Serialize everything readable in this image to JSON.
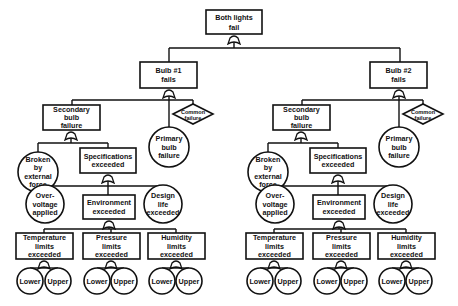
{
  "diagram": {
    "type": "fault-tree",
    "colors": {
      "stroke": "#111111",
      "background": "#ffffff",
      "caption": "#777777"
    },
    "top_event": {
      "lines": [
        "Both lights",
        "fail"
      ]
    },
    "branches": [
      {
        "id": "bulb1",
        "event": {
          "lines": [
            "Bulb #1",
            "fails"
          ]
        },
        "secondary": {
          "lines": [
            "Secondary",
            "bulb",
            "failure"
          ]
        },
        "primary": {
          "lines": [
            "Primary",
            "bulb",
            "failure"
          ]
        },
        "common": {
          "lines": [
            "Common",
            "failure"
          ]
        },
        "broken": {
          "lines": [
            "Broken",
            "by",
            "external",
            "force"
          ]
        },
        "specs": {
          "lines": [
            "Specifications",
            "exceeded"
          ]
        },
        "overvoltage": {
          "lines": [
            "Over-",
            "voltage",
            "applied"
          ]
        },
        "environment": {
          "lines": [
            "Environment",
            "exceeded"
          ]
        },
        "design_life": {
          "lines": [
            "Design",
            "life",
            "exceeded"
          ]
        },
        "temperature": {
          "lines": [
            "Temperature",
            "limits",
            "exceeded"
          ]
        },
        "pressure": {
          "lines": [
            "Pressure",
            "limits",
            "exceeded"
          ]
        },
        "humidity": {
          "lines": [
            "Humidity",
            "limits",
            "exceeded"
          ]
        },
        "lower_label": "Lower",
        "upper_label": "Upper"
      },
      {
        "id": "bulb2",
        "event": {
          "lines": [
            "Bulb #2",
            "fails"
          ]
        },
        "secondary": {
          "lines": [
            "Secondary",
            "bulb",
            "failure"
          ]
        },
        "primary": {
          "lines": [
            "Primary",
            "bulb",
            "failure"
          ]
        },
        "common": {
          "lines": [
            "Common",
            "failure"
          ]
        },
        "broken": {
          "lines": [
            "Broken",
            "by",
            "external",
            "force"
          ]
        },
        "specs": {
          "lines": [
            "Specifications",
            "exceeded"
          ]
        },
        "overvoltage": {
          "lines": [
            "Over-",
            "voltage",
            "applied"
          ]
        },
        "environment": {
          "lines": [
            "Environment",
            "exceeded"
          ]
        },
        "design_life": {
          "lines": [
            "Design",
            "life",
            "exceeded"
          ]
        },
        "temperature": {
          "lines": [
            "Temperature",
            "limits",
            "exceeded"
          ]
        },
        "pressure": {
          "lines": [
            "Pressure",
            "limits",
            "exceeded"
          ]
        },
        "humidity": {
          "lines": [
            "Humidity",
            "limits",
            "exceeded"
          ]
        },
        "lower_label": "Lower",
        "upper_label": "Upper"
      }
    ]
  }
}
